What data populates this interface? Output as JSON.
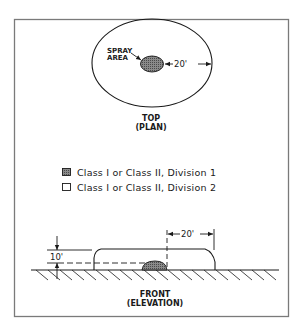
{
  "figure": {
    "top_view": {
      "spray_label_line1": "SPRAY",
      "spray_label_line2": "AREA",
      "distance_label": "20'",
      "caption_line1": "TOP",
      "caption_line2": "(PLAN)"
    },
    "legend": {
      "items": [
        {
          "label": "Class I or Class II, Division 1",
          "swatch": "shaded"
        },
        {
          "label": "Class I or Class II, Division 2",
          "swatch": "empty"
        }
      ]
    },
    "front_view": {
      "height_label": "10'",
      "distance_label": "20'",
      "caption_line1": "FRONT",
      "caption_line2": "(ELEVATION)"
    },
    "colors": {
      "line": "#1a1a1a",
      "shade": "#6e6e6e",
      "frame": "#7a7a7a"
    }
  }
}
